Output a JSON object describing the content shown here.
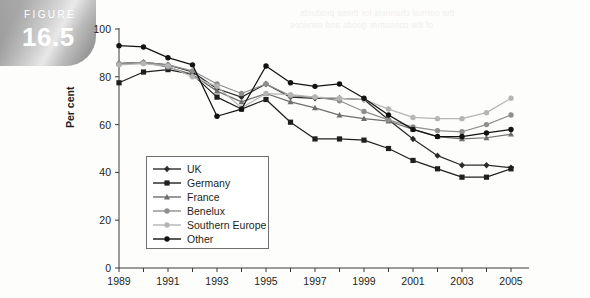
{
  "figure": {
    "word": "FIGURE",
    "number": "16.5"
  },
  "chart_data": {
    "type": "line",
    "title": "",
    "xlabel": "",
    "ylabel": "Per cent",
    "xlim": [
      1989,
      2005
    ],
    "ylim": [
      0,
      100
    ],
    "yticks": [
      0,
      20,
      40,
      60,
      80,
      100
    ],
    "xticks": [
      1989,
      1990,
      1991,
      1992,
      1993,
      1994,
      1995,
      1996,
      1997,
      1998,
      1999,
      2000,
      2001,
      2002,
      2003,
      2004,
      2005
    ],
    "xtick_labels": [
      "1989",
      "",
      "1991",
      "",
      "1993",
      "",
      "1995",
      "",
      "1997",
      "",
      "1999",
      "",
      "2001",
      "",
      "2003",
      "",
      "2005"
    ],
    "grid": false,
    "legend_position": "inside-left",
    "x": [
      1989,
      1990,
      1991,
      1992,
      1993,
      1994,
      1995,
      1996,
      1997,
      1998,
      1999,
      2000,
      2001,
      2002,
      2003,
      2004,
      2005
    ],
    "series": [
      {
        "name": "UK",
        "color": "#2b2b2b",
        "marker": "diamond",
        "values": [
          85.5,
          86.0,
          85.0,
          82.0,
          75.0,
          71.5,
          77.0,
          71.5,
          71.0,
          71.0,
          70.5,
          62.0,
          54.0,
          47.0,
          43.0,
          43.0,
          42.0
        ]
      },
      {
        "name": "Germany",
        "color": "#1f1f1f",
        "marker": "square",
        "values": [
          77.5,
          82.0,
          83.0,
          81.0,
          71.5,
          66.5,
          70.5,
          61.0,
          54.0,
          54.0,
          53.5,
          50.0,
          45.0,
          41.5,
          38.0,
          38.0,
          41.5
        ]
      },
      {
        "name": "France",
        "color": "#6e6e6e",
        "marker": "triangle",
        "values": [
          85.5,
          86.0,
          84.0,
          81.0,
          74.0,
          69.5,
          73.0,
          69.5,
          67.0,
          64.0,
          62.5,
          61.5,
          58.0,
          55.0,
          54.0,
          54.5,
          56.0
        ]
      },
      {
        "name": "Benelux",
        "color": "#8f8f8f",
        "marker": "circle",
        "values": [
          85.5,
          86.0,
          85.0,
          82.5,
          77.0,
          73.0,
          77.0,
          72.0,
          71.5,
          70.0,
          65.5,
          62.0,
          59.0,
          57.5,
          57.0,
          60.0,
          64.0
        ]
      },
      {
        "name": "Southern Europe",
        "color": "#b5b5b5",
        "marker": "circle",
        "values": [
          85.0,
          85.5,
          84.5,
          80.0,
          76.0,
          67.0,
          73.0,
          72.5,
          71.5,
          71.0,
          70.5,
          66.5,
          63.0,
          62.5,
          62.5,
          65.0,
          71.0
        ]
      },
      {
        "name": "Other",
        "color": "#121212",
        "marker": "circle",
        "values": [
          93.0,
          92.5,
          88.0,
          85.0,
          63.5,
          66.5,
          84.5,
          77.5,
          76.0,
          77.0,
          71.0,
          64.0,
          58.0,
          55.0,
          55.0,
          56.5,
          58.0
        ]
      }
    ]
  },
  "bleed_text": [
    "the normal channels for these products",
    "of the consumer goods and services"
  ]
}
